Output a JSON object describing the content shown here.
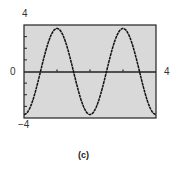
{
  "chart_data": {
    "type": "line",
    "title": "",
    "caption": "(c)",
    "xlabel": "",
    "ylabel": "",
    "xlim": [
      0,
      4
    ],
    "ylim": [
      -4,
      4
    ],
    "x_tick_labels": {
      "min": "0",
      "max": "4"
    },
    "y_tick_labels": {
      "max": "4",
      "min": "−4"
    },
    "x_ticks": [
      1,
      2,
      3
    ],
    "y_ticks": [
      -3,
      -2,
      -1,
      1,
      2,
      3
    ],
    "grid": false,
    "background": "#d9d9d9",
    "series": [
      {
        "name": "y = -3.7 cos(πx)",
        "function": "-3.7*cos(pi*x)",
        "x": [
          0,
          0.5,
          1,
          1.5,
          2,
          2.5,
          3,
          3.5,
          4
        ],
        "y": [
          -3.7,
          0,
          3.7,
          0,
          -3.7,
          0,
          3.7,
          0,
          -3.7
        ]
      }
    ]
  }
}
